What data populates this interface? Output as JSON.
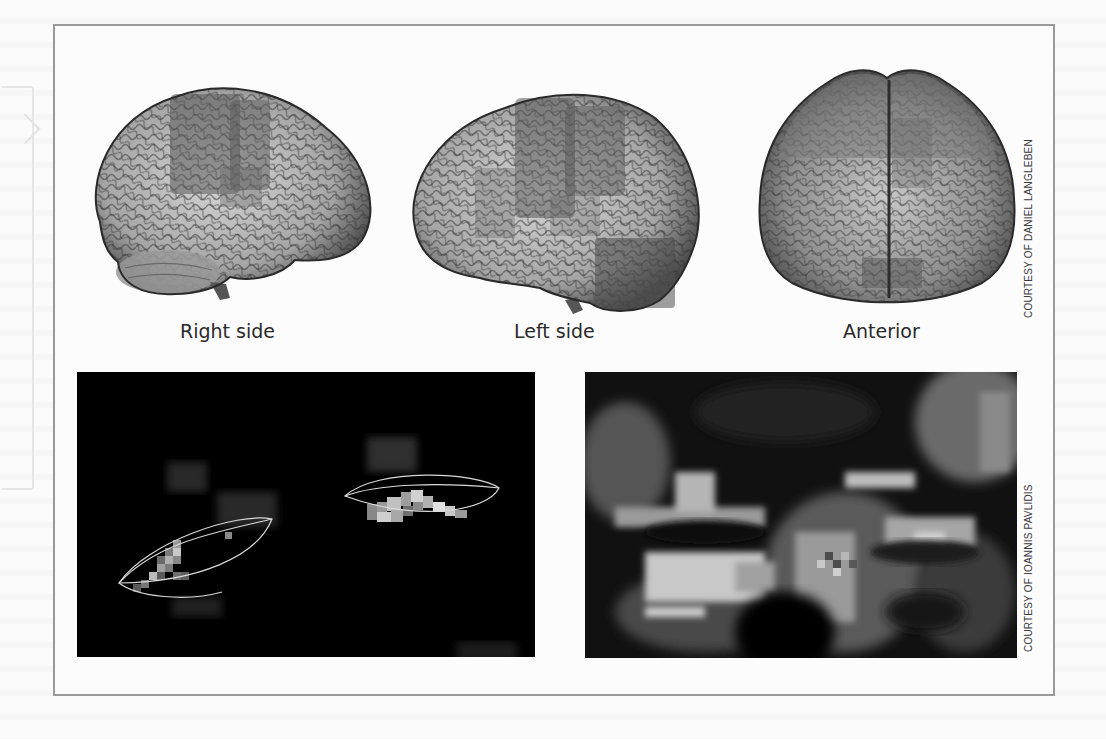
{
  "figure": {
    "brain_views": [
      {
        "id": "right",
        "caption": "Right side"
      },
      {
        "id": "left",
        "caption": "Left side"
      },
      {
        "id": "anterior",
        "caption": "Anterior"
      }
    ],
    "credits": {
      "top": "COURTESY OF DANIEL LANGLEBEN",
      "bottom": "COURTESY OF IOANNIS PAVLIDIS"
    },
    "panels": {
      "thermal": {
        "description": "thermal scan with periorbital regions outlined"
      },
      "face": {
        "description": "pixelated thermal face image"
      }
    },
    "colors": {
      "frame": "#9a9a9a",
      "panel_bg": "#000000",
      "outline": "#d9d9d9",
      "caption_text": "#2a2a2a"
    }
  }
}
